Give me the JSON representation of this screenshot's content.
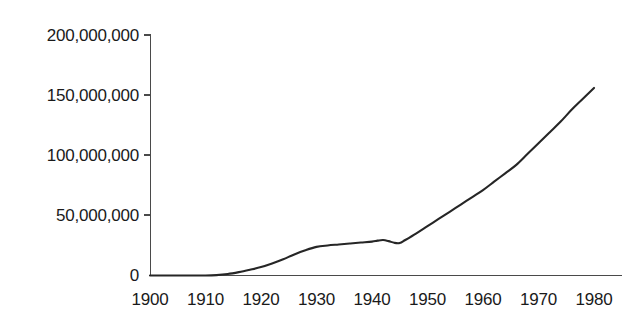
{
  "chart_data": {
    "type": "line",
    "title": "",
    "subtitle": "",
    "xlabel": "",
    "ylabel": "",
    "xlim": [
      1900,
      1980
    ],
    "ylim": [
      0,
      200000000
    ],
    "grid": false,
    "legend": false,
    "legend_position": "none",
    "line_color": "#262626",
    "axis_color": "#4a4a4a",
    "background_color": "#ffffff",
    "x_tick_labels": [
      "1900",
      "1910",
      "1920",
      "1930",
      "1940",
      "1950",
      "1960",
      "1970",
      "1980"
    ],
    "x_ticks": [
      1900,
      1910,
      1920,
      1930,
      1940,
      1950,
      1960,
      1970,
      1980
    ],
    "y_tick_labels": [
      "0",
      "50,000,000",
      "100,000,000",
      "150,000,000",
      "200,000,000"
    ],
    "y_ticks": [
      0,
      50000000,
      100000000,
      150000000,
      200000000
    ],
    "series": [
      {
        "name": "value",
        "x": [
          1900,
          1905,
          1910,
          1912,
          1914,
          1916,
          1918,
          1920,
          1922,
          1924,
          1926,
          1928,
          1930,
          1932,
          1934,
          1936,
          1938,
          1940,
          1941,
          1942,
          1943,
          1944,
          1945,
          1946,
          1948,
          1950,
          1952,
          1954,
          1956,
          1958,
          1960,
          1962,
          1964,
          1966,
          1968,
          1970,
          1972,
          1974,
          1976,
          1978,
          1980
        ],
        "values": [
          0,
          0,
          0,
          300000,
          1200000,
          2800000,
          4800000,
          7000000,
          10000000,
          13500000,
          17500000,
          21000000,
          23800000,
          25000000,
          25800000,
          26600000,
          27400000,
          28200000,
          29000000,
          29500000,
          28600000,
          27200000,
          27000000,
          29500000,
          35000000,
          41000000,
          47000000,
          53000000,
          59000000,
          65000000,
          71000000,
          78000000,
          85000000,
          92000000,
          101000000,
          110000000,
          119000000,
          128000000,
          138000000,
          147000000,
          156000000
        ]
      }
    ],
    "annotations": []
  }
}
